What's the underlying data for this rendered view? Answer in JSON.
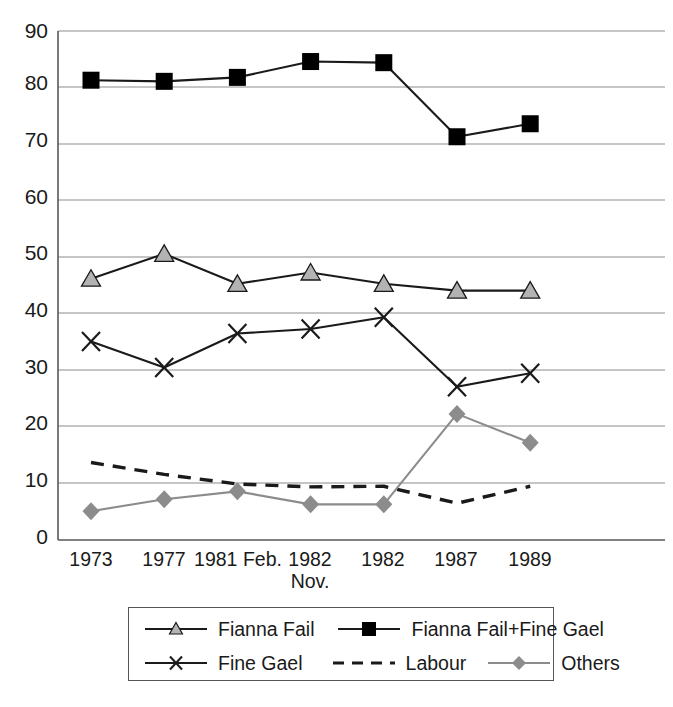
{
  "chart_data": {
    "type": "line",
    "title": "",
    "xlabel": "",
    "ylabel": "",
    "ylim": [
      0,
      90
    ],
    "ytick_step": 10,
    "grid": true,
    "legend_position": "bottom",
    "categories": [
      "1973",
      "1977",
      "1981",
      "Feb. 1982",
      "Nov. 1982",
      "1987",
      "1989"
    ],
    "xtick_labels": [
      {
        "line1": "1973",
        "line2": ""
      },
      {
        "line1": "1977",
        "line2": ""
      },
      {
        "line1": "1981 Feb.",
        "line2": ""
      },
      {
        "line1": "1982",
        "line2": "Nov."
      },
      {
        "line1": "1982",
        "line2": ""
      },
      {
        "line1": "1987",
        "line2": ""
      },
      {
        "line1": "1989",
        "line2": ""
      }
    ],
    "ytick_labels": [
      "90",
      "80",
      "70",
      "60",
      "50",
      "40",
      "30",
      "20",
      "10",
      "0"
    ],
    "series": [
      {
        "name": "Fianna Fail",
        "marker": "triangle",
        "marker_fill": "#b3b3b3",
        "line_color": "#1a1a1a",
        "line_style": "solid",
        "values": [
          46.2,
          50.6,
          45.3,
          47.3,
          45.3,
          44.1,
          44.1
        ]
      },
      {
        "name": "Fianna Fail+Fine Gael",
        "marker": "square",
        "marker_fill": "#000000",
        "line_color": "#1a1a1a",
        "line_style": "solid",
        "values": [
          81.3,
          81.1,
          81.8,
          84.6,
          84.4,
          71.3,
          73.6
        ]
      },
      {
        "name": "Fine Gael",
        "marker": "cross",
        "marker_fill": "#1a1a1a",
        "line_color": "#1a1a1a",
        "line_style": "solid",
        "values": [
          35.1,
          30.5,
          36.5,
          37.3,
          39.4,
          27.1,
          29.5
        ]
      },
      {
        "name": "Labour",
        "marker": "none",
        "marker_fill": "#1a1a1a",
        "line_color": "#1a1a1a",
        "line_style": "dashed",
        "values": [
          13.7,
          11.6,
          9.9,
          9.4,
          9.5,
          6.5,
          9.5
        ]
      },
      {
        "name": "Others",
        "marker": "diamond",
        "marker_fill": "#8c8c8c",
        "line_color": "#8c8c8c",
        "line_style": "solid",
        "values": [
          5.1,
          7.2,
          8.6,
          6.3,
          6.3,
          22.3,
          17.2
        ]
      }
    ]
  },
  "legend": {
    "rows": [
      [
        {
          "name": "Fianna Fail",
          "symbol": "triangle-line"
        },
        {
          "name": "Fianna Fail+Fine Gael",
          "symbol": "square-line"
        }
      ],
      [
        {
          "name": "Fine Gael",
          "symbol": "cross-line"
        },
        {
          "name": "Labour",
          "symbol": "dashed-line"
        },
        {
          "name": "Others",
          "symbol": "diamond-line"
        }
      ]
    ]
  },
  "colors": {
    "axis": "#595959",
    "grid": "#8c8c8c",
    "dark_line": "#1a1a1a",
    "gray_line": "#8c8c8c",
    "triangle_fill": "#b3b3b3",
    "diamond_fill": "#8c8c8c",
    "square_fill": "#000000",
    "text": "#1a1a1a"
  }
}
